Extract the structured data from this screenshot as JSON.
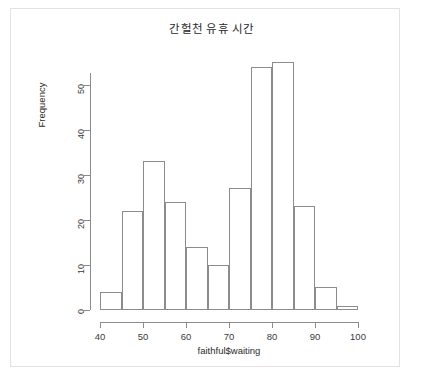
{
  "chart_data": {
    "type": "bar",
    "title": "간헐천 유휴 시간",
    "xlabel": "faithful$waiting",
    "ylabel": "Frequency",
    "categories": [
      "40-45",
      "45-50",
      "50-55",
      "55-60",
      "60-65",
      "65-70",
      "70-75",
      "75-80",
      "80-85",
      "85-90",
      "90-95",
      "95-100"
    ],
    "bin_starts": [
      40,
      45,
      50,
      55,
      60,
      65,
      70,
      75,
      80,
      85,
      90,
      95
    ],
    "bin_width": 5,
    "values": [
      4,
      22,
      33,
      24,
      14,
      10,
      27,
      54,
      55,
      23,
      5,
      1
    ],
    "xlim": [
      40,
      100
    ],
    "ylim": [
      0,
      55
    ],
    "x_ticks": [
      40,
      50,
      60,
      70,
      80,
      90,
      100
    ],
    "y_ticks": [
      0,
      10,
      20,
      30,
      40,
      50
    ],
    "x_tick_labels": [
      "40",
      "50",
      "60",
      "70",
      "80",
      "90",
      "100"
    ],
    "y_tick_labels": [
      "0",
      "10",
      "20",
      "30",
      "40",
      "50"
    ],
    "grid": false,
    "legend": false,
    "bar_fill": "#ffffff",
    "bar_border": "#8c8c8c",
    "axis_color": "#8c8c8c",
    "text_color": "#2b2b2b",
    "background": "#ffffff",
    "frame_color": "#e2e2e2"
  }
}
